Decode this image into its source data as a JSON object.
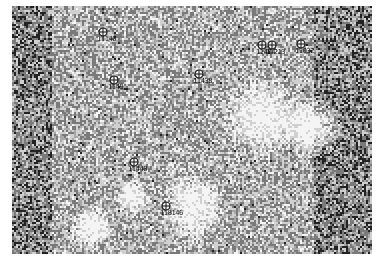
{
  "map": {
    "palette": {
      "white": "#f4f4f4",
      "light": "#d0d0d0",
      "mid": "#a8a8a8",
      "dark": "#7a7a7a",
      "black": "#222222"
    },
    "markers": [
      {
        "id": "m1",
        "label": "11140",
        "x": 103,
        "y": 32
      },
      {
        "id": "m2",
        "label": "1149",
        "x": 114,
        "y": 80
      },
      {
        "id": "m3",
        "label": "11438",
        "x": 199,
        "y": 74
      },
      {
        "id": "m4",
        "label": "11404",
        "x": 262,
        "y": 45
      },
      {
        "id": "m5",
        "label": "11213",
        "x": 272,
        "y": 45
      },
      {
        "id": "m6",
        "label": "11032",
        "x": 301,
        "y": 44
      },
      {
        "id": "m7",
        "label": "11440",
        "x": 134,
        "y": 162
      },
      {
        "id": "m8",
        "label": "118146",
        "x": 166,
        "y": 206
      }
    ]
  }
}
